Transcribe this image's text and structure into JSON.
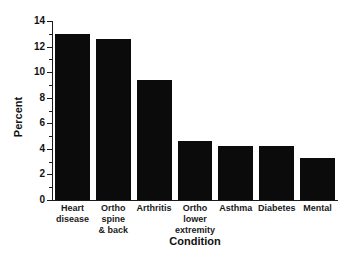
{
  "chart_data": {
    "type": "bar",
    "title": "",
    "xlabel": "Condition",
    "ylabel": "Percent",
    "categories": [
      "Heart\ndisease",
      "Ortho\nspine\n& back",
      "Arthritis",
      "Ortho\nlower\nextremity",
      "Asthma",
      "Diabetes",
      "Mental"
    ],
    "category_lines": [
      [
        "Heart",
        "disease"
      ],
      [
        "Ortho",
        "spine",
        "& back"
      ],
      [
        "Arthritis"
      ],
      [
        "Ortho",
        "lower",
        "extremity"
      ],
      [
        "Asthma"
      ],
      [
        "Diabetes"
      ],
      [
        "Mental"
      ]
    ],
    "values": [
      13.0,
      12.6,
      9.4,
      4.6,
      4.2,
      4.2,
      3.3
    ],
    "ylim": [
      0,
      14
    ],
    "ytick_labels": [
      "0",
      "2",
      "4",
      "6",
      "8",
      "10",
      "12",
      "14"
    ],
    "ytick_values": [
      0,
      2,
      4,
      6,
      8,
      10,
      12,
      14
    ],
    "yminor_values": [
      1,
      3,
      5,
      7,
      9,
      11,
      13
    ],
    "grid": false,
    "legend": "none",
    "bar_color": "#0b0b0b",
    "axis_color": "#1a1a1a",
    "background": "#ffffff"
  }
}
